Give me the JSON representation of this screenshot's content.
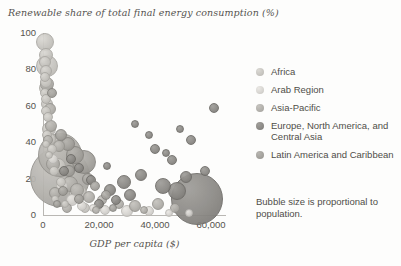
{
  "chart_data": {
    "type": "scatter",
    "title": "Renewable share of total final energy consumption (%)",
    "xlabel": "GDP per capita ($)",
    "ylabel": "Renewable share of total final energy consumption (%)",
    "xlim": [
      0,
      65000
    ],
    "ylim": [
      0,
      100
    ],
    "xticks": [
      0,
      20000,
      40000,
      60000
    ],
    "xticklabels": [
      "0",
      "20,000",
      "40,000",
      "60,000"
    ],
    "yticks": [
      0,
      20,
      40,
      60,
      80,
      100
    ],
    "yticklabels": [
      "0",
      "20",
      "40",
      "60",
      "80",
      "100"
    ],
    "grid": false,
    "legend_position": "right",
    "size_note": "Bubble size is proportional to population.",
    "series": [
      {
        "name": "Africa",
        "color": "#c9c7c2",
        "points": [
          {
            "x": 700,
            "y": 95,
            "r": 9
          },
          {
            "x": 900,
            "y": 88,
            "r": 7
          },
          {
            "x": 800,
            "y": 84,
            "r": 6
          },
          {
            "x": 1500,
            "y": 82,
            "r": 11
          },
          {
            "x": 1100,
            "y": 79,
            "r": 6
          },
          {
            "x": 700,
            "y": 76,
            "r": 5
          },
          {
            "x": 900,
            "y": 73,
            "r": 6
          },
          {
            "x": 1200,
            "y": 70,
            "r": 7
          },
          {
            "x": 800,
            "y": 67,
            "r": 5
          },
          {
            "x": 1000,
            "y": 64,
            "r": 5
          },
          {
            "x": 1400,
            "y": 61,
            "r": 6
          },
          {
            "x": 900,
            "y": 57,
            "r": 5
          },
          {
            "x": 1700,
            "y": 54,
            "r": 5
          },
          {
            "x": 2100,
            "y": 47,
            "r": 7
          },
          {
            "x": 1500,
            "y": 44,
            "r": 5
          },
          {
            "x": 2600,
            "y": 42,
            "r": 6
          },
          {
            "x": 1200,
            "y": 39,
            "r": 4
          },
          {
            "x": 3300,
            "y": 36,
            "r": 5
          },
          {
            "x": 2200,
            "y": 33,
            "r": 4
          },
          {
            "x": 5200,
            "y": 27,
            "r": 8
          },
          {
            "x": 3800,
            "y": 24,
            "r": 5
          },
          {
            "x": 6400,
            "y": 18,
            "r": 5
          },
          {
            "x": 12500,
            "y": 12,
            "r": 9
          },
          {
            "x": 4200,
            "y": 9,
            "r": 4
          },
          {
            "x": 8000,
            "y": 6,
            "r": 4
          },
          {
            "x": 15000,
            "y": 4,
            "r": 5
          }
        ]
      },
      {
        "name": "Arab Region",
        "color": "#d8d6d2",
        "points": [
          {
            "x": 3400,
            "y": 31,
            "r": 5
          },
          {
            "x": 6800,
            "y": 16,
            "r": 6
          },
          {
            "x": 10500,
            "y": 8,
            "r": 6
          },
          {
            "x": 14000,
            "y": 5,
            "r": 5
          },
          {
            "x": 22000,
            "y": 3,
            "r": 5
          },
          {
            "x": 30000,
            "y": 2,
            "r": 6
          },
          {
            "x": 38000,
            "y": 2,
            "r": 5
          },
          {
            "x": 45000,
            "y": 1,
            "r": 4
          },
          {
            "x": 52000,
            "y": 1,
            "r": 4
          },
          {
            "x": 18000,
            "y": 4,
            "r": 4
          }
        ]
      },
      {
        "name": "Asia-Pacific",
        "color": "#b3b1ac",
        "points": [
          {
            "x": 1600,
            "y": 72,
            "r": 7
          },
          {
            "x": 2400,
            "y": 58,
            "r": 6
          },
          {
            "x": 2900,
            "y": 49,
            "r": 6
          },
          {
            "x": 1900,
            "y": 41,
            "r": 5
          },
          {
            "x": 5600,
            "y": 38,
            "r": 6
          },
          {
            "x": 6200,
            "y": 33,
            "r": 22
          },
          {
            "x": 3600,
            "y": 28,
            "r": 7
          },
          {
            "x": 5900,
            "y": 21,
            "r": 30
          },
          {
            "x": 9500,
            "y": 17,
            "r": 8
          },
          {
            "x": 12000,
            "y": 14,
            "r": 7
          },
          {
            "x": 4400,
            "y": 12,
            "r": 6
          },
          {
            "x": 16500,
            "y": 10,
            "r": 6
          },
          {
            "x": 21000,
            "y": 8,
            "r": 5
          },
          {
            "x": 27000,
            "y": 6,
            "r": 5
          },
          {
            "x": 33000,
            "y": 5,
            "r": 6
          },
          {
            "x": 41000,
            "y": 6,
            "r": 6
          },
          {
            "x": 47000,
            "y": 4,
            "r": 5
          },
          {
            "x": 8500,
            "y": 4,
            "r": 5
          },
          {
            "x": 19000,
            "y": 3,
            "r": 4
          },
          {
            "x": 36000,
            "y": 3,
            "r": 4
          }
        ]
      },
      {
        "name": "Europe, North America, and Central Asia",
        "color": "#8d8b87",
        "points": [
          {
            "x": 55000,
            "y": 9,
            "r": 26
          },
          {
            "x": 48000,
            "y": 13,
            "r": 9
          },
          {
            "x": 43000,
            "y": 16,
            "r": 8
          },
          {
            "x": 51000,
            "y": 21,
            "r": 6
          },
          {
            "x": 58000,
            "y": 24,
            "r": 5
          },
          {
            "x": 46000,
            "y": 30,
            "r": 5
          },
          {
            "x": 40000,
            "y": 36,
            "r": 5
          },
          {
            "x": 53000,
            "y": 41,
            "r": 5
          },
          {
            "x": 38000,
            "y": 44,
            "r": 4
          },
          {
            "x": 61000,
            "y": 59,
            "r": 5
          },
          {
            "x": 44000,
            "y": 34,
            "r": 4
          },
          {
            "x": 35000,
            "y": 22,
            "r": 6
          },
          {
            "x": 29000,
            "y": 18,
            "r": 7
          },
          {
            "x": 24000,
            "y": 14,
            "r": 6
          },
          {
            "x": 31000,
            "y": 11,
            "r": 6
          },
          {
            "x": 26000,
            "y": 8,
            "r": 5
          },
          {
            "x": 20000,
            "y": 6,
            "r": 5
          },
          {
            "x": 17000,
            "y": 19,
            "r": 5
          },
          {
            "x": 13000,
            "y": 26,
            "r": 5
          },
          {
            "x": 10000,
            "y": 31,
            "r": 5
          },
          {
            "x": 7500,
            "y": 24,
            "r": 5
          },
          {
            "x": 23000,
            "y": 27,
            "r": 4
          },
          {
            "x": 49000,
            "y": 47,
            "r": 4
          },
          {
            "x": 33000,
            "y": 50,
            "r": 4
          }
        ]
      },
      {
        "name": "Latin America and Caribbean",
        "color": "#a5a39e",
        "points": [
          {
            "x": 3100,
            "y": 67,
            "r": 5
          },
          {
            "x": 6600,
            "y": 44,
            "r": 6
          },
          {
            "x": 8800,
            "y": 39,
            "r": 7
          },
          {
            "x": 11500,
            "y": 33,
            "r": 9
          },
          {
            "x": 14500,
            "y": 29,
            "r": 12
          },
          {
            "x": 9200,
            "y": 24,
            "r": 6
          },
          {
            "x": 16000,
            "y": 20,
            "r": 6
          },
          {
            "x": 18500,
            "y": 16,
            "r": 5
          },
          {
            "x": 7200,
            "y": 13,
            "r": 5
          },
          {
            "x": 12800,
            "y": 9,
            "r": 5
          },
          {
            "x": 22500,
            "y": 11,
            "r": 5
          },
          {
            "x": 5000,
            "y": 6,
            "r": 4
          },
          {
            "x": 25000,
            "y": 4,
            "r": 4
          }
        ]
      }
    ]
  },
  "legend": {
    "items": [
      {
        "label": "Africa"
      },
      {
        "label": "Arab Region"
      },
      {
        "label": "Asia-Pacific"
      },
      {
        "label": "Europe, North America, and Central Asia"
      },
      {
        "label": "Latin America and Caribbean"
      }
    ]
  }
}
